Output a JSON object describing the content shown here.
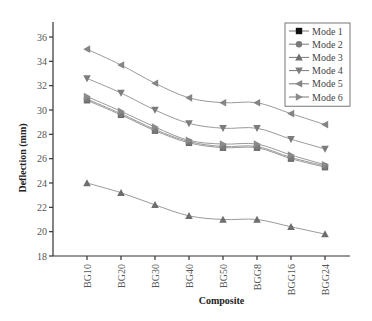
{
  "chart_data": {
    "type": "line",
    "title": "",
    "xlabel": "Composite",
    "ylabel": "Deflection (mm)",
    "categories": [
      "BG10",
      "BG20",
      "BG30",
      "BG40",
      "BG50",
      "BGG8",
      "BGG16",
      "BGG24"
    ],
    "ylim": [
      18,
      37
    ],
    "yticks": [
      18,
      20,
      22,
      24,
      26,
      28,
      30,
      32,
      34,
      36
    ],
    "grid": false,
    "legend_position": "top-right",
    "series": [
      {
        "name": "Mode 1",
        "marker": "square",
        "color": "#6a6a6a",
        "values": [
          30.8,
          29.6,
          28.3,
          27.3,
          26.9,
          26.9,
          26.0,
          25.3
        ]
      },
      {
        "name": "Mode 2",
        "marker": "circle",
        "color": "#7a7a7a",
        "values": [
          30.9,
          29.7,
          28.4,
          27.4,
          27.0,
          27.0,
          26.1,
          25.4
        ]
      },
      {
        "name": "Mode 3",
        "marker": "triangle-up",
        "color": "#6e6e6e",
        "values": [
          24.0,
          23.2,
          22.2,
          21.3,
          21.0,
          21.0,
          20.4,
          19.8
        ]
      },
      {
        "name": "Mode 4",
        "marker": "triangle-down",
        "color": "#7c7c7c",
        "values": [
          32.6,
          31.4,
          30.0,
          28.9,
          28.5,
          28.5,
          27.6,
          26.8
        ]
      },
      {
        "name": "Mode 5",
        "marker": "triangle-left",
        "color": "#858585",
        "values": [
          35.0,
          33.7,
          32.2,
          31.0,
          30.6,
          30.6,
          29.7,
          28.8
        ]
      },
      {
        "name": "Mode 6",
        "marker": "triangle-right",
        "color": "#8a8a8a",
        "values": [
          31.1,
          29.9,
          28.6,
          27.5,
          27.2,
          27.2,
          26.3,
          25.5
        ]
      }
    ],
    "legend_marker_color_mode1": "#111111"
  }
}
